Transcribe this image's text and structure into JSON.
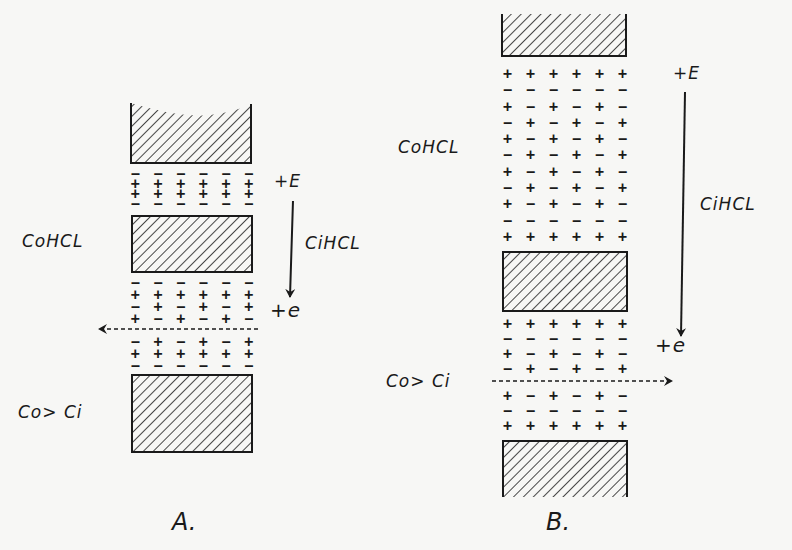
{
  "figure": {
    "panels": [
      {
        "id": "A",
        "caption": "A.",
        "left_label_top": "CoHCL",
        "left_label_bottom": "Co> Ci",
        "arrow_top_label": "+E",
        "arrow_mid_label": "CiHCL",
        "arrow_bottom_label": "+e",
        "flow_arrow_direction": "left",
        "charge_layer_top": [
          [
            "−",
            "−",
            "−",
            "−",
            "−",
            "−"
          ],
          [
            "+",
            "+",
            "+",
            "+",
            "+",
            "+"
          ],
          [
            "+",
            "+",
            "+",
            "+",
            "+",
            "+"
          ],
          [
            "−",
            "−",
            "−",
            "−",
            "−",
            "−"
          ]
        ],
        "charge_layer_bottom_upper": [
          [
            "−",
            "−",
            "−",
            "−",
            "−",
            "−"
          ],
          [
            "+",
            "+",
            "+",
            "+",
            "+",
            "+"
          ],
          [
            "−",
            "+",
            "−",
            "+",
            "−",
            "+"
          ],
          [
            "+",
            "−",
            "+",
            "−",
            "+",
            "−"
          ]
        ],
        "charge_layer_bottom_lower": [
          [
            "−",
            "+",
            "−",
            "+",
            "−",
            "+"
          ],
          [
            "+",
            "+",
            "+",
            "+",
            "+",
            "+"
          ],
          [
            "−",
            "−",
            "−",
            "−",
            "−",
            "−"
          ]
        ]
      },
      {
        "id": "B",
        "caption": "B.",
        "left_label_top": "CoHCL",
        "left_label_bottom": "Co> Ci",
        "arrow_top_label": "+E",
        "arrow_mid_label": "CiHCL",
        "arrow_bottom_label": "+e",
        "flow_arrow_direction": "right",
        "charge_layer_top": [
          [
            "+",
            "+",
            "+",
            "+",
            "+",
            "+"
          ],
          [
            "−",
            "−",
            "−",
            "−",
            "−",
            "−"
          ],
          [
            "+",
            "−",
            "+",
            "−",
            "+",
            "−"
          ],
          [
            "−",
            "+",
            "−",
            "+",
            "−",
            "+"
          ],
          [
            "+",
            "−",
            "+",
            "−",
            "+",
            "−"
          ],
          [
            "−",
            "+",
            "−",
            "+",
            "−",
            "+"
          ],
          [
            "+",
            "−",
            "+",
            "−",
            "+",
            "−"
          ],
          [
            "−",
            "+",
            "−",
            "+",
            "−",
            "+"
          ],
          [
            "+",
            "−",
            "+",
            "−",
            "+",
            "−"
          ],
          [
            "−",
            "−",
            "−",
            "−",
            "−",
            "−"
          ],
          [
            "+",
            "+",
            "+",
            "+",
            "+",
            "+"
          ]
        ],
        "charge_layer_bottom_upper": [
          [
            "+",
            "+",
            "+",
            "+",
            "+",
            "+"
          ],
          [
            "−",
            "−",
            "−",
            "−",
            "−",
            "−"
          ],
          [
            "+",
            "−",
            "+",
            "−",
            "+",
            "−"
          ],
          [
            "−",
            "+",
            "−",
            "+",
            "−",
            "+"
          ]
        ],
        "charge_layer_bottom_lower": [
          [
            "+",
            "−",
            "+",
            "−",
            "+",
            "−"
          ],
          [
            "−",
            "−",
            "−",
            "−",
            "−",
            "−"
          ],
          [
            "+",
            "+",
            "+",
            "+",
            "+",
            "+"
          ]
        ]
      }
    ],
    "colors": {
      "ink": "#1a1a1a",
      "paper": "#f7f7f5"
    }
  }
}
